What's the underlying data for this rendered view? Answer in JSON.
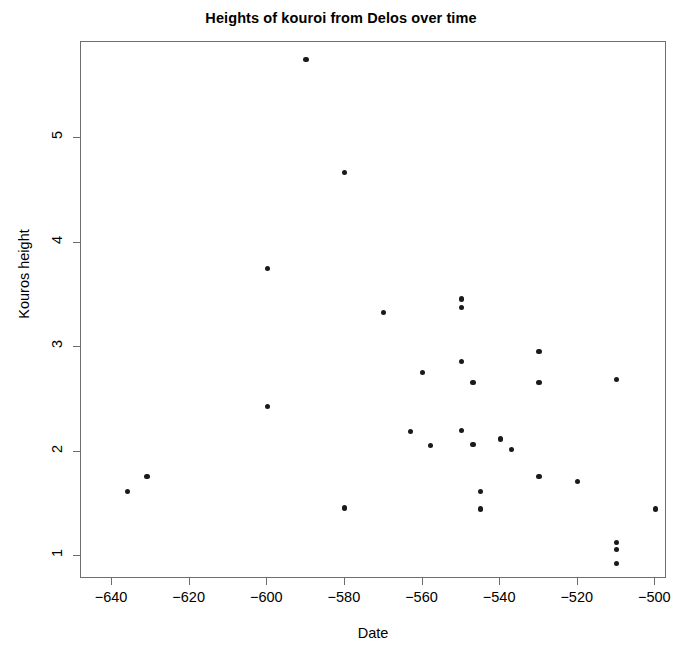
{
  "chart_data": {
    "type": "scatter",
    "title": "Heights of kouroi from Delos over time",
    "xlabel": "Date",
    "ylabel": "Kouros height",
    "xlim": [
      -648,
      -497
    ],
    "ylim": [
      0.78,
      5.92
    ],
    "grid": false,
    "legend": null,
    "xticks": [
      -640,
      -620,
      -600,
      -580,
      -560,
      -540,
      -520,
      -500
    ],
    "xtick_labels": [
      "-640",
      "-620",
      "-600",
      "-580",
      "-560",
      "-540",
      "-520",
      "-500"
    ],
    "yticks": [
      1,
      2,
      3,
      4,
      5
    ],
    "ytick_labels": [
      "1",
      "2",
      "3",
      "4",
      "5"
    ],
    "point_color": "#1a1a1a",
    "frame_color": "#6e6e6e",
    "background": "#ffffff",
    "n_points": 30,
    "x": [
      -636,
      -631,
      -600,
      -600,
      -590,
      -580,
      -580,
      -570,
      -563,
      -560,
      -558,
      -550,
      -550,
      -550,
      -550,
      -547,
      -547,
      -545,
      -545,
      -540,
      -537,
      -530,
      -530,
      -530,
      -520,
      -510,
      -510,
      -510,
      -510,
      -500
    ],
    "y": [
      1.62,
      1.76,
      3.75,
      2.43,
      5.75,
      4.67,
      1.46,
      3.33,
      2.19,
      2.76,
      2.06,
      3.46,
      3.38,
      2.86,
      2.2,
      2.66,
      2.07,
      1.62,
      1.45,
      2.12,
      2.02,
      2.96,
      2.66,
      1.76,
      1.71,
      2.69,
      1.13,
      1.06,
      0.93,
      1.45
    ],
    "points": [
      {
        "date": -636,
        "height": 1.62
      },
      {
        "date": -631,
        "height": 1.76
      },
      {
        "date": -600,
        "height": 3.75
      },
      {
        "date": -600,
        "height": 2.43
      },
      {
        "date": -590,
        "height": 5.75
      },
      {
        "date": -580,
        "height": 4.67
      },
      {
        "date": -580,
        "height": 1.46
      },
      {
        "date": -570,
        "height": 3.33
      },
      {
        "date": -563,
        "height": 2.19
      },
      {
        "date": -560,
        "height": 2.76
      },
      {
        "date": -558,
        "height": 2.06
      },
      {
        "date": -550,
        "height": 3.46
      },
      {
        "date": -550,
        "height": 3.38
      },
      {
        "date": -550,
        "height": 2.86
      },
      {
        "date": -550,
        "height": 2.2
      },
      {
        "date": -547,
        "height": 2.66
      },
      {
        "date": -547,
        "height": 2.07
      },
      {
        "date": -545,
        "height": 1.62
      },
      {
        "date": -545,
        "height": 1.45
      },
      {
        "date": -540,
        "height": 2.12
      },
      {
        "date": -537,
        "height": 2.02
      },
      {
        "date": -530,
        "height": 2.96
      },
      {
        "date": -530,
        "height": 2.66
      },
      {
        "date": -530,
        "height": 1.76
      },
      {
        "date": -520,
        "height": 1.71
      },
      {
        "date": -510,
        "height": 2.69
      },
      {
        "date": -510,
        "height": 1.13
      },
      {
        "date": -510,
        "height": 1.06
      },
      {
        "date": -510,
        "height": 0.93
      },
      {
        "date": -500,
        "height": 1.45
      }
    ]
  }
}
